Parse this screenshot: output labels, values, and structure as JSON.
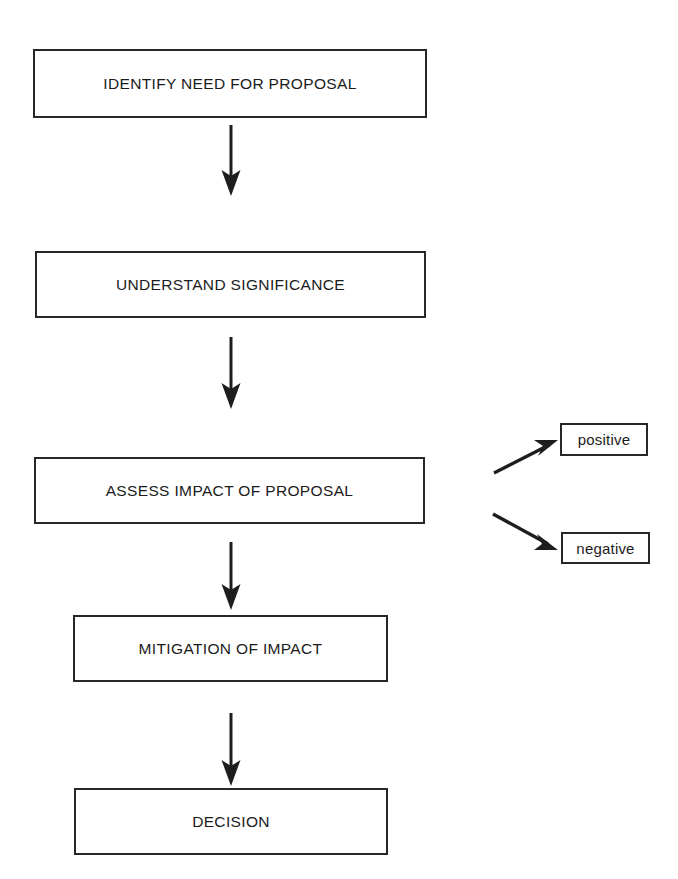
{
  "diagram": {
    "background_color": "#ffffff",
    "line_color": "#1e1e1e",
    "text_color": "#1b1b1b"
  },
  "nodes": [
    {
      "id": "identify",
      "label": "IDENTIFY NEED FOR PROPOSAL",
      "x": 33,
      "y": 49,
      "w": 394,
      "h": 69
    },
    {
      "id": "understand",
      "label": "UNDERSTAND SIGNIFICANCE",
      "x": 35,
      "y": 251,
      "w": 391,
      "h": 67
    },
    {
      "id": "assess",
      "label": "ASSESS IMPACT OF PROPOSAL",
      "x": 34,
      "y": 457,
      "w": 391,
      "h": 67
    },
    {
      "id": "mitigation",
      "label": "MITIGATION OF IMPACT",
      "x": 73,
      "y": 615,
      "w": 315,
      "h": 67
    },
    {
      "id": "decision",
      "label": "DECISION",
      "x": 74,
      "y": 788,
      "w": 314,
      "h": 67
    }
  ],
  "outcomes": [
    {
      "id": "positive",
      "label": "positive",
      "x": 560,
      "y": 423,
      "w": 88,
      "h": 33
    },
    {
      "id": "negative",
      "label": "negative",
      "x": 561,
      "y": 532,
      "w": 89,
      "h": 32
    }
  ],
  "connectors": [
    {
      "id": "identify-to-understand",
      "from": "identify",
      "to": "understand",
      "kind": "vertical-arrow",
      "x": 231,
      "y1": 125,
      "y2": 196
    },
    {
      "id": "understand-to-assess",
      "from": "understand",
      "to": "assess",
      "kind": "vertical-arrow",
      "x": 231,
      "y1": 337,
      "y2": 409
    },
    {
      "id": "assess-to-mitigation",
      "from": "assess",
      "to": "mitigation",
      "kind": "vertical-arrow",
      "x": 231,
      "y1": 542,
      "y2": 610
    },
    {
      "id": "mitigation-to-decision",
      "from": "mitigation",
      "to": "decision",
      "kind": "vertical-arrow",
      "x": 231,
      "y1": 713,
      "y2": 786
    },
    {
      "id": "assess-to-positive",
      "from": "assess",
      "to": "positive",
      "kind": "diagonal-arrow-up",
      "x1": 494,
      "y1": 473,
      "x2": 557,
      "y2": 441
    },
    {
      "id": "assess-to-negative",
      "from": "assess",
      "to": "negative",
      "kind": "diagonal-arrow-down",
      "x1": 493,
      "y1": 514,
      "x2": 557,
      "y2": 549
    }
  ]
}
